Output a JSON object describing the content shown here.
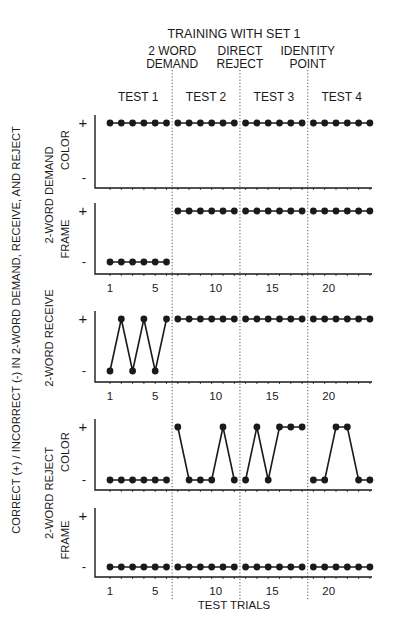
{
  "chart_data": {
    "type": "line",
    "title": "TRAINING WITH SET 1",
    "xlabel": "TEST TRIALS",
    "ylabel": "CORRECT (+) / INCORRECT (-)  IN  2-WORD DEMAND, RECEIVE, AND REJECT",
    "x": [
      1,
      2,
      3,
      4,
      5,
      6,
      7,
      8,
      9,
      10,
      11,
      12,
      13,
      14,
      15,
      16,
      17,
      18,
      19,
      20,
      21,
      22,
      23,
      24
    ],
    "x_tick_labels": [
      "1",
      "5",
      "10",
      "15",
      "20"
    ],
    "x_tick_values": [
      1,
      5,
      10,
      15,
      20
    ],
    "y_levels": [
      "-",
      "+"
    ],
    "phases": [
      {
        "label": "TEST 1",
        "trials": [
          1,
          6
        ]
      },
      {
        "label": "TEST 2",
        "trials": [
          7,
          12
        ]
      },
      {
        "label": "TEST 3",
        "trials": [
          13,
          18
        ]
      },
      {
        "label": "TEST 4",
        "trials": [
          19,
          24
        ]
      }
    ],
    "training_markers": [
      {
        "after_trial": 6,
        "label_line1": "2 WORD",
        "label_line2": "DEMAND"
      },
      {
        "after_trial": 12,
        "label_line1": "DIRECT",
        "label_line2": "REJECT"
      },
      {
        "after_trial": 18,
        "label_line1": "IDENTITY",
        "label_line2": "POINT"
      }
    ],
    "series": [
      {
        "name": "2-WORD DEMAND COLOR",
        "group": "2-WORD DEMAND",
        "sub": "COLOR",
        "values": [
          1,
          1,
          1,
          1,
          1,
          1,
          1,
          1,
          1,
          1,
          1,
          1,
          1,
          1,
          1,
          1,
          1,
          1,
          1,
          1,
          1,
          1,
          1,
          1
        ]
      },
      {
        "name": "2-WORD DEMAND FRAME",
        "group": "2-WORD DEMAND",
        "sub": "FRAME",
        "values": [
          0,
          0,
          0,
          0,
          0,
          0,
          1,
          1,
          1,
          1,
          1,
          1,
          1,
          1,
          1,
          1,
          1,
          1,
          1,
          1,
          1,
          1,
          1,
          1
        ]
      },
      {
        "name": "2-WORD RECEIVE",
        "group": "2-WORD RECEIVE",
        "sub": "",
        "values": [
          0,
          1,
          0,
          1,
          0,
          1,
          1,
          1,
          1,
          1,
          1,
          1,
          1,
          1,
          1,
          1,
          1,
          1,
          1,
          1,
          1,
          1,
          1,
          1
        ]
      },
      {
        "name": "2-WORD REJECT COLOR",
        "group": "2-WORD REJECT",
        "sub": "COLOR",
        "values": [
          0,
          0,
          0,
          0,
          0,
          0,
          1,
          0,
          0,
          0,
          1,
          0,
          0,
          1,
          0,
          1,
          1,
          1,
          0,
          0,
          1,
          1,
          0,
          0
        ]
      },
      {
        "name": "2-WORD REJECT FRAME",
        "group": "2-WORD REJECT",
        "sub": "FRAME",
        "values": [
          0,
          0,
          0,
          0,
          0,
          0,
          0,
          0,
          0,
          0,
          0,
          0,
          0,
          0,
          0,
          0,
          0,
          0,
          0,
          0,
          0,
          0,
          0,
          0
        ]
      }
    ],
    "value_encoding": {
      "1": "+ (correct)",
      "0": "- (incorrect)"
    },
    "grid": false,
    "legend": null
  },
  "labels": {
    "title": "TRAINING WITH SET 1",
    "xlabel": "TEST TRIALS",
    "ylabel": "CORRECT (+) / INCORRECT (-)  IN  2-WORD DEMAND, RECEIVE, AND REJECT",
    "plus": "+",
    "minus": "-",
    "panel_labels": {
      "demand_group": "2-WORD DEMAND",
      "demand_color": "COLOR",
      "demand_frame": "FRAME",
      "receive": "2-WORD RECEIVE",
      "reject_group": "2-WORD REJECT",
      "reject_color": "COLOR",
      "reject_frame": "FRAME"
    }
  }
}
